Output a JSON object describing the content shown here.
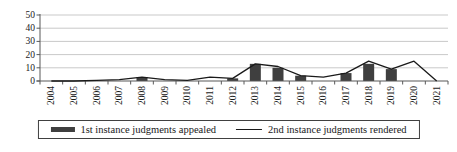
{
  "chart_data": {
    "type": "bar",
    "subtype": "combo-bar-line",
    "title": "",
    "xlabel": "",
    "ylabel": "",
    "categories": [
      "2004",
      "2005",
      "2006",
      "2007",
      "2008",
      "2009",
      "2010",
      "2011",
      "2012",
      "2013",
      "2014",
      "2015",
      "2016",
      "2017",
      "2018",
      "2019",
      "2020",
      "2021"
    ],
    "series": [
      {
        "name": "1st instance judgments appealed",
        "type": "bar",
        "values": [
          0,
          0,
          0,
          0,
          3,
          0,
          0,
          0,
          2,
          13,
          10,
          4,
          0,
          6,
          13,
          9,
          0,
          0
        ]
      },
      {
        "name": "2nd instance judgments rendered",
        "type": "line",
        "values": [
          0,
          0,
          0.5,
          1,
          3,
          1,
          0.5,
          3,
          2,
          13,
          11,
          4,
          3,
          6,
          15,
          9,
          15,
          0
        ]
      }
    ],
    "ylim": [
      0,
      50
    ],
    "yticks": [
      0,
      10,
      20,
      30,
      40,
      50
    ],
    "grid": "horizontal",
    "legend_position": "bottom"
  },
  "legend": {
    "items": [
      {
        "label": "1st instance judgments appealed",
        "swatch": "bar-swatch-icon"
      },
      {
        "label": "2nd instance judgments rendered",
        "swatch": "line-swatch-icon"
      }
    ]
  },
  "colors": {
    "bar": "#3f3f3f",
    "line": "#1a1a1a",
    "grid": "#c9c9c9",
    "axis": "#595959",
    "text": "#1a1a1a",
    "background": "#ffffff"
  }
}
